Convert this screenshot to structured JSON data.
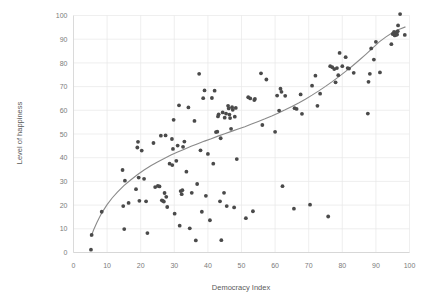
{
  "chart_data": {
    "type": "scatter",
    "title": "",
    "xlabel": "Democracy Index",
    "ylabel": "Level of happiness",
    "xlim": [
      0,
      100
    ],
    "ylim": [
      0,
      100
    ],
    "xticks": [
      0,
      10,
      20,
      30,
      40,
      50,
      60,
      70,
      80,
      90,
      100
    ],
    "yticks": [
      0,
      10,
      20,
      30,
      40,
      50,
      60,
      70,
      80,
      90,
      100
    ],
    "grid": true,
    "legend": "none",
    "point_color": "#4a4a4a",
    "trend_color": "#8a8a8a",
    "grid_color": "#e8e8e8",
    "axis_text_color": "#7b7b7b",
    "series": [
      {
        "name": "countries",
        "points": [
          [
            5.2,
            1.2
          ],
          [
            5.4,
            7.4
          ],
          [
            8.4,
            17.2
          ],
          [
            14.6,
            34.8
          ],
          [
            14.8,
            19.6
          ],
          [
            15.3,
            30.3
          ],
          [
            15.1,
            9.9
          ],
          [
            16.4,
            20.9
          ],
          [
            18.6,
            26.7
          ],
          [
            19.2,
            46.7
          ],
          [
            19.0,
            44.3
          ],
          [
            19.4,
            31.6
          ],
          [
            19.6,
            21.8
          ],
          [
            20.3,
            43.0
          ],
          [
            21.0,
            31.1
          ],
          [
            21.6,
            21.6
          ],
          [
            22.0,
            8.2
          ],
          [
            23.8,
            46.2
          ],
          [
            24.3,
            27.6
          ],
          [
            25.1,
            28.1
          ],
          [
            25.6,
            27.9
          ],
          [
            26.0,
            49.3
          ],
          [
            26.3,
            22.0
          ],
          [
            26.6,
            21.8
          ],
          [
            26.9,
            21.5
          ],
          [
            27.1,
            25.1
          ],
          [
            27.4,
            49.4
          ],
          [
            27.6,
            23.5
          ],
          [
            27.9,
            19.2
          ],
          [
            28.6,
            37.5
          ],
          [
            29.3,
            47.9
          ],
          [
            29.4,
            36.9
          ],
          [
            29.6,
            43.7
          ],
          [
            29.8,
            56.0
          ],
          [
            30.1,
            16.4
          ],
          [
            30.6,
            38.7
          ],
          [
            31.0,
            45.1
          ],
          [
            31.4,
            62.1
          ],
          [
            31.6,
            11.3
          ],
          [
            31.9,
            25.9
          ],
          [
            32.2,
            24.6
          ],
          [
            32.4,
            26.3
          ],
          [
            32.6,
            44.6
          ],
          [
            33.0,
            46.8
          ],
          [
            33.6,
            34.1
          ],
          [
            34.2,
            61.2
          ],
          [
            34.6,
            10.2
          ],
          [
            35.2,
            25.2
          ],
          [
            36.0,
            55.5
          ],
          [
            36.4,
            5.1
          ],
          [
            36.8,
            28.9
          ],
          [
            37.4,
            75.4
          ],
          [
            37.8,
            43.1
          ],
          [
            38.2,
            17.2
          ],
          [
            38.6,
            65.1
          ],
          [
            39.0,
            68.4
          ],
          [
            39.4,
            23.9
          ],
          [
            40.0,
            41.6
          ],
          [
            40.6,
            13.6
          ],
          [
            41.2,
            65.2
          ],
          [
            41.6,
            37.5
          ],
          [
            42.0,
            68.3
          ],
          [
            42.4,
            50.8
          ],
          [
            42.8,
            51.0
          ],
          [
            43.0,
            57.4
          ],
          [
            43.2,
            58.3
          ],
          [
            43.6,
            21.6
          ],
          [
            43.8,
            48.2
          ],
          [
            44.0,
            5.2
          ],
          [
            44.4,
            59.1
          ],
          [
            44.8,
            25.2
          ],
          [
            45.0,
            56.9
          ],
          [
            45.4,
            58.6
          ],
          [
            45.6,
            19.6
          ],
          [
            46.0,
            61.9
          ],
          [
            46.2,
            60.8
          ],
          [
            46.4,
            58.2
          ],
          [
            46.6,
            56.7
          ],
          [
            46.9,
            52.2
          ],
          [
            47.2,
            61.3
          ],
          [
            47.4,
            60.2
          ],
          [
            47.8,
            19.0
          ],
          [
            48.0,
            57.3
          ],
          [
            48.3,
            61.0
          ],
          [
            48.6,
            39.4
          ],
          [
            51.3,
            14.5
          ],
          [
            52.0,
            65.5
          ],
          [
            52.6,
            65.0
          ],
          [
            53.4,
            17.4
          ],
          [
            53.8,
            64.3
          ],
          [
            54.0,
            64.8
          ],
          [
            55.8,
            75.6
          ],
          [
            56.2,
            53.8
          ],
          [
            57.4,
            73.0
          ],
          [
            60.0,
            50.9
          ],
          [
            60.6,
            66.2
          ],
          [
            61.2,
            59.9
          ],
          [
            61.6,
            69.1
          ],
          [
            61.9,
            67.8
          ],
          [
            62.2,
            28.0
          ],
          [
            63.0,
            66.1
          ],
          [
            65.6,
            18.5
          ],
          [
            65.8,
            60.9
          ],
          [
            66.4,
            60.6
          ],
          [
            67.6,
            66.7
          ],
          [
            68.0,
            58.5
          ],
          [
            70.4,
            20.2
          ],
          [
            71.0,
            70.4
          ],
          [
            72.0,
            74.6
          ],
          [
            72.6,
            61.9
          ],
          [
            73.4,
            67.0
          ],
          [
            75.8,
            15.2
          ],
          [
            76.4,
            78.6
          ],
          [
            77.0,
            78.2
          ],
          [
            77.6,
            77.4
          ],
          [
            78.0,
            71.8
          ],
          [
            78.4,
            77.8
          ],
          [
            78.8,
            74.8
          ],
          [
            79.2,
            84.2
          ],
          [
            80.0,
            78.6
          ],
          [
            81.0,
            82.4
          ],
          [
            81.6,
            77.8
          ],
          [
            82.0,
            77.6
          ],
          [
            83.4,
            75.8
          ],
          [
            87.6,
            58.6
          ],
          [
            87.8,
            72.0
          ],
          [
            88.2,
            75.4
          ],
          [
            88.6,
            86.1
          ],
          [
            89.4,
            81.4
          ],
          [
            90.0,
            88.9
          ],
          [
            91.2,
            76.0
          ],
          [
            94.6,
            87.9
          ],
          [
            95.0,
            92.2
          ],
          [
            95.4,
            93.1
          ],
          [
            95.6,
            91.6
          ],
          [
            95.8,
            92.6
          ],
          [
            96.0,
            91.8
          ],
          [
            96.1,
            92.9
          ],
          [
            96.3,
            92.0
          ],
          [
            96.5,
            93.4
          ],
          [
            96.6,
            95.8
          ],
          [
            97.2,
            100.6
          ],
          [
            98.6,
            91.8
          ]
        ]
      }
    ],
    "trendline": {
      "kind": "logarithmic",
      "points": [
        [
          5.2,
          6.6
        ],
        [
          6.0,
          9.6
        ],
        [
          7.0,
          12.8
        ],
        [
          8.0,
          15.6
        ],
        [
          9.0,
          18.0
        ],
        [
          10.0,
          20.2
        ],
        [
          11.5,
          23.0
        ],
        [
          13.0,
          25.4
        ],
        [
          15.0,
          28.2
        ],
        [
          17.0,
          30.6
        ],
        [
          19.0,
          32.8
        ],
        [
          21.0,
          34.8
        ],
        [
          23.0,
          36.6
        ],
        [
          25.0,
          38.2
        ],
        [
          27.0,
          39.7
        ],
        [
          29.0,
          41.1
        ],
        [
          31.0,
          42.4
        ],
        [
          33.0,
          43.6
        ],
        [
          35.0,
          44.8
        ],
        [
          37.0,
          45.9
        ],
        [
          39.0,
          47.0
        ],
        [
          41.0,
          48.0
        ],
        [
          43.0,
          49.1
        ],
        [
          45.0,
          50.1
        ],
        [
          47.0,
          51.1
        ],
        [
          49.0,
          52.1
        ],
        [
          51.0,
          53.1
        ],
        [
          53.0,
          54.2
        ],
        [
          55.0,
          55.3
        ],
        [
          57.0,
          56.4
        ],
        [
          59.0,
          57.6
        ],
        [
          61.0,
          58.9
        ],
        [
          63.0,
          60.2
        ],
        [
          65.0,
          61.6
        ],
        [
          67.0,
          63.1
        ],
        [
          69.0,
          64.7
        ],
        [
          71.0,
          66.4
        ],
        [
          73.0,
          68.2
        ],
        [
          75.0,
          70.1
        ],
        [
          77.0,
          72.1
        ],
        [
          79.0,
          74.2
        ],
        [
          81.0,
          76.4
        ],
        [
          83.0,
          78.7
        ],
        [
          85.0,
          81.1
        ],
        [
          87.0,
          83.6
        ],
        [
          89.0,
          86.2
        ],
        [
          91.0,
          88.9
        ],
        [
          93.0,
          91.0
        ],
        [
          95.0,
          92.8
        ],
        [
          97.0,
          94.2
        ],
        [
          98.8,
          95.2
        ]
      ]
    }
  },
  "axes": {
    "x_title": "Democracy Index",
    "y_title": "Level of happiness"
  }
}
